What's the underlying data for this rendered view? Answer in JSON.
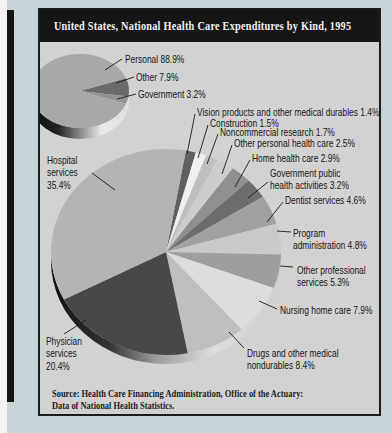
{
  "figure": {
    "title": "United States, National Health Care Expenditures by Kind, 1995",
    "source_line1": "Source: Health Care Financing Administration, Office of the Actuary:",
    "source_line2": "Data of National Health Statistics.",
    "colors": {
      "page_background": "#c6d5d8",
      "panel_background": "#d2d2d2",
      "title_bar": "#161616",
      "title_text": "#f2f2f2",
      "leader_line": "#1a1a1a"
    }
  },
  "chart_data": [
    {
      "type": "pie",
      "name": "summary-pie",
      "unit": "%",
      "legend_position": "right-labels",
      "layout": {
        "cx": 40,
        "cy": 81,
        "rx": 49,
        "ry": 37,
        "depth": 11,
        "start_angle": 70
      },
      "depth_stops": [
        [
          0,
          "#0a0a0a"
        ],
        [
          0.28,
          "#242424"
        ],
        [
          0.5,
          "#8a8a8a"
        ],
        [
          0.72,
          "#e9e9e9"
        ],
        [
          1,
          "#e0e0e0"
        ]
      ],
      "slices": [
        {
          "label": "Other",
          "value": 7.9,
          "display": "Other 7.9%",
          "color": "#6b6b6b",
          "text_pos": [
            96,
            61
          ],
          "leader": [
            94,
            67,
            76,
            73
          ]
        },
        {
          "label": "Government",
          "value": 3.2,
          "display": "Government 3.2%",
          "color": "#929292",
          "text_pos": [
            98,
            78
          ],
          "leader": [
            96,
            84,
            77,
            89
          ]
        },
        {
          "label": "Personal",
          "value": 88.9,
          "display": "Personal 88.9%",
          "color": "#a8a8a8",
          "text_pos": [
            85,
            43
          ],
          "leader": [
            82,
            49,
            65,
            60
          ]
        }
      ]
    },
    {
      "type": "pie",
      "name": "detail-pie",
      "unit": "%",
      "legend_position": "callout-labels",
      "layout": {
        "cx": 126,
        "cy": 242,
        "rx": 115,
        "ry": 103,
        "depth": 9,
        "start_angle": 10
      },
      "depth_stops": [
        [
          0,
          "#101010"
        ],
        [
          0.25,
          "#333333"
        ],
        [
          0.45,
          "#999999"
        ],
        [
          0.7,
          "#dddddd"
        ],
        [
          1,
          "#cfcfcf"
        ]
      ],
      "slices": [
        {
          "label": "Vision products and other medical durables",
          "value": 1.4,
          "display": "Vision products and other medical durables 1.4%",
          "color": "#5f5f5f",
          "text_pos": [
            157,
            96
          ],
          "leader": [
            155,
            104,
            147,
            144
          ]
        },
        {
          "label": "Construction",
          "value": 1.5,
          "display": "Construction 1.5%",
          "color": "#efefef",
          "text_pos": [
            170,
            107
          ],
          "leader": [
            168,
            115,
            158,
            148
          ]
        },
        {
          "label": "Noncommercial research",
          "value": 1.7,
          "display": "Noncommercial research 1.7%",
          "color": "#bfbfbf",
          "text_pos": [
            180,
            116
          ],
          "leader": [
            178,
            124,
            167,
            154
          ]
        },
        {
          "label": "Other personal health care",
          "value": 2.5,
          "display": "Other personal health care 2.5%",
          "color": "#cdcdcd",
          "text_pos": [
            194,
            127
          ],
          "leader": [
            192,
            135,
            182,
            164
          ]
        },
        {
          "label": "Home health care",
          "value": 2.9,
          "display": "Home health care 2.9%",
          "color": "#8f8f8f",
          "text_pos": [
            212,
            142
          ],
          "leader": [
            210,
            150,
            195,
            177
          ]
        },
        {
          "label": "Government public health activities",
          "value": 3.2,
          "display": "Government public\nhealth activities 3.2%",
          "color": "#6d6d6d",
          "text_pos": [
            230,
            157
          ],
          "leader": [
            228,
            172,
            208,
            188
          ]
        },
        {
          "label": "Dentist services",
          "value": 4.6,
          "display": "Dentist services 4.6%",
          "color": "#a0a0a0",
          "text_pos": [
            245,
            184
          ],
          "leader": [
            243,
            192,
            227,
            212
          ]
        },
        {
          "label": "Program administration",
          "value": 4.8,
          "display": "Program\nadministration 4.8%",
          "color": "#c9c9c9",
          "text_pos": [
            253,
            217
          ],
          "leader": [
            251,
            222,
            237,
            221
          ]
        },
        {
          "label": "Other professional services",
          "value": 5.3,
          "display": "Other professional\nservices 5.3%",
          "color": "#9e9e9e",
          "text_pos": [
            257,
            254
          ],
          "leader": [
            253,
            257,
            240,
            256
          ]
        },
        {
          "label": "Nursing home care",
          "value": 7.9,
          "display": "Nursing home care 7.9%",
          "color": "#dcdcdc",
          "text_pos": [
            240,
            294
          ],
          "leader": [
            237,
            299,
            219,
            291
          ]
        },
        {
          "label": "Drugs and other medical nondurables",
          "value": 8.4,
          "display": "Drugs and other medical\nnondurables 8.4%",
          "color": "#bfbfbf",
          "text_pos": [
            207,
            337
          ],
          "leader": [
            204,
            338,
            189,
            322
          ]
        },
        {
          "label": "Physician services",
          "value": 20.4,
          "display": "Physician\nservices\n20.4%",
          "color": "#484848",
          "text_pos": [
            6,
            325
          ],
          "leader": [
            24,
            324,
            46,
            310
          ]
        },
        {
          "label": "Hospital services",
          "value": 35.4,
          "display": "Hospital\nservices\n35.4%",
          "color": "#b4b4b4",
          "text_pos": [
            7,
            144
          ],
          "leader": [
            52,
            163,
            75,
            180
          ]
        }
      ]
    }
  ]
}
